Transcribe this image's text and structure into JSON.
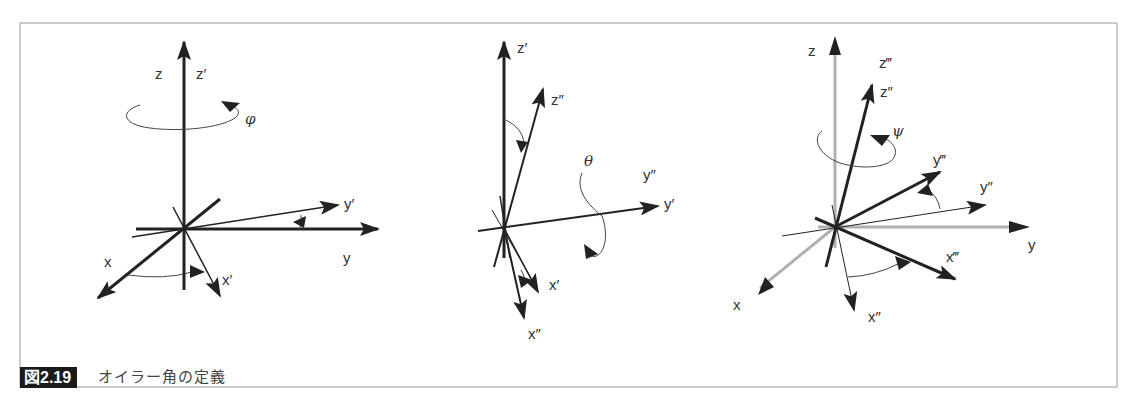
{
  "caption": {
    "figure_number": "図2.19",
    "title": "オイラー角の定義"
  },
  "diagrams": [
    {
      "id": "rotation-phi",
      "angle_symbol": "φ",
      "labels": {
        "z": "z",
        "z_prime": "z′",
        "y": "y",
        "y_prime": "y′",
        "x": "x",
        "x_prime": "x′"
      }
    },
    {
      "id": "rotation-theta",
      "angle_symbol": "θ",
      "labels": {
        "z_prime": "z′",
        "z_dprime": "z″",
        "y_prime": "y′",
        "y_dprime": "y″",
        "x_prime": "x′",
        "x_dprime": "x″"
      }
    },
    {
      "id": "rotation-psi",
      "angle_symbol": "ψ",
      "labels": {
        "z": "z",
        "z_tprime": "z‴",
        "z_dprime": "z″",
        "y_tprime": "y‴",
        "y_dprime": "y″",
        "y": "y",
        "x_tprime": "x‴",
        "x": "x",
        "x_dprime": "x″"
      }
    }
  ],
  "colors": {
    "axis_dark": "#222222",
    "axis_gray": "#b0b0b0",
    "border": "#999999",
    "caption_bg": "#1a1a1a"
  }
}
